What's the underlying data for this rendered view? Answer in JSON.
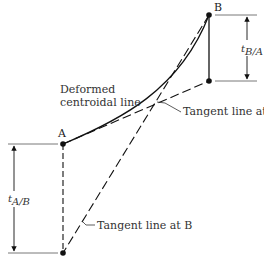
{
  "diagram": {
    "labels": {
      "point_a": "A",
      "point_b": "B",
      "curve_line1": "Deformed",
      "curve_line2": "centroidal line",
      "tangent_a": "Tangent line at A",
      "tangent_b": "Tangent line at B",
      "t_ba_main": "t",
      "t_ba_sub": "B/A",
      "t_ab_main": "t",
      "t_ab_sub": "A/B"
    },
    "colors": {
      "stroke": "#111111",
      "guide": "#555555",
      "text": "#333333"
    }
  }
}
